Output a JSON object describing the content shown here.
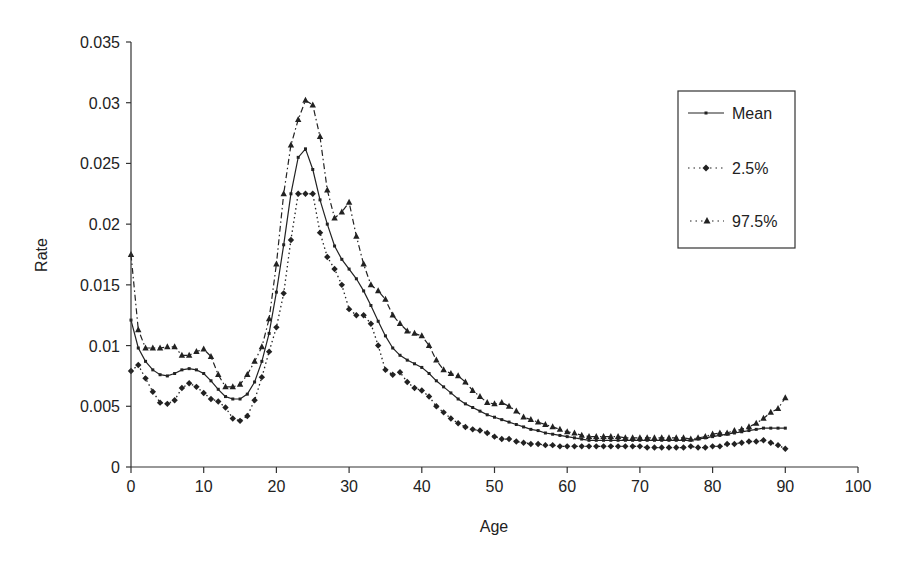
{
  "chart_data": {
    "type": "line",
    "title": "",
    "xlabel": "Age",
    "ylabel": "Rate",
    "xlim": [
      0,
      100
    ],
    "ylim": [
      0,
      0.035
    ],
    "x_ticks": [
      "0",
      "10",
      "20",
      "30",
      "40",
      "50",
      "60",
      "70",
      "80",
      "90",
      "100"
    ],
    "y_ticks": [
      "0",
      "0.005",
      "0.01",
      "0.015",
      "0.02",
      "0.025",
      "0.03",
      "0.035"
    ],
    "grid": false,
    "legend_position": "upper right (boxed)",
    "x": [
      0,
      1,
      2,
      3,
      4,
      5,
      6,
      7,
      8,
      9,
      10,
      11,
      12,
      13,
      14,
      15,
      16,
      17,
      18,
      19,
      20,
      21,
      22,
      23,
      24,
      25,
      26,
      27,
      28,
      29,
      30,
      31,
      32,
      33,
      34,
      35,
      36,
      37,
      38,
      39,
      40,
      41,
      42,
      43,
      44,
      45,
      46,
      47,
      48,
      49,
      50,
      51,
      52,
      53,
      54,
      55,
      56,
      57,
      58,
      59,
      60,
      61,
      62,
      63,
      64,
      65,
      66,
      67,
      68,
      69,
      70,
      71,
      72,
      73,
      74,
      75,
      76,
      77,
      78,
      79,
      80,
      81,
      82,
      83,
      84,
      85,
      86,
      87,
      88,
      89,
      90
    ],
    "series": [
      {
        "name": "Mean",
        "line_style": "solid",
        "marker": "small-square",
        "values": [
          0.0121,
          0.0098,
          0.0087,
          0.008,
          0.0076,
          0.0075,
          0.0077,
          0.008,
          0.0081,
          0.008,
          0.0077,
          0.0071,
          0.0064,
          0.0058,
          0.0056,
          0.0056,
          0.006,
          0.007,
          0.0087,
          0.011,
          0.0144,
          0.0183,
          0.0225,
          0.0255,
          0.0262,
          0.0245,
          0.022,
          0.02,
          0.0182,
          0.0171,
          0.0163,
          0.0155,
          0.0145,
          0.0133,
          0.012,
          0.0108,
          0.0098,
          0.0092,
          0.0088,
          0.0085,
          0.0082,
          0.0077,
          0.0071,
          0.0066,
          0.0061,
          0.0056,
          0.0052,
          0.0049,
          0.0046,
          0.0043,
          0.0041,
          0.0039,
          0.0037,
          0.0035,
          0.0033,
          0.0031,
          0.003,
          0.0028,
          0.0027,
          0.0026,
          0.0025,
          0.0024,
          0.0023,
          0.0022,
          0.0022,
          0.0022,
          0.0022,
          0.0022,
          0.0022,
          0.0022,
          0.0022,
          0.0022,
          0.0022,
          0.0022,
          0.0022,
          0.0022,
          0.0022,
          0.0022,
          0.0023,
          0.0024,
          0.0025,
          0.0026,
          0.0027,
          0.0028,
          0.0029,
          0.003,
          0.0031,
          0.0032,
          0.0032,
          0.0032,
          0.0032
        ]
      },
      {
        "name": "2.5%",
        "line_style": "dotted",
        "marker": "diamond",
        "values": [
          0.0079,
          0.0084,
          0.0073,
          0.0062,
          0.0053,
          0.0052,
          0.0055,
          0.0065,
          0.0069,
          0.0066,
          0.0061,
          0.0056,
          0.0054,
          0.0049,
          0.004,
          0.0038,
          0.0042,
          0.0055,
          0.0074,
          0.0095,
          0.0115,
          0.0143,
          0.0187,
          0.0225,
          0.0225,
          0.0225,
          0.0193,
          0.0173,
          0.0163,
          0.015,
          0.013,
          0.0125,
          0.0125,
          0.0118,
          0.01,
          0.008,
          0.0076,
          0.0078,
          0.007,
          0.0065,
          0.0063,
          0.0058,
          0.005,
          0.0045,
          0.004,
          0.0036,
          0.0033,
          0.0031,
          0.003,
          0.0028,
          0.0025,
          0.0023,
          0.0023,
          0.0021,
          0.002,
          0.0019,
          0.0019,
          0.0018,
          0.0018,
          0.0017,
          0.0017,
          0.0017,
          0.0017,
          0.0017,
          0.0017,
          0.0017,
          0.0017,
          0.0017,
          0.0017,
          0.0017,
          0.0017,
          0.0016,
          0.0016,
          0.0016,
          0.0016,
          0.0016,
          0.0016,
          0.0017,
          0.0016,
          0.0016,
          0.0017,
          0.0017,
          0.0019,
          0.0019,
          0.002,
          0.0021,
          0.0021,
          0.0022,
          0.002,
          0.0018,
          0.0015
        ]
      },
      {
        "name": "97.5%",
        "line_style": "dash-dot",
        "marker": "triangle",
        "values": [
          0.0175,
          0.0113,
          0.0098,
          0.0098,
          0.0098,
          0.0099,
          0.0099,
          0.0092,
          0.0092,
          0.0095,
          0.0097,
          0.0091,
          0.0076,
          0.0066,
          0.0066,
          0.0068,
          0.0076,
          0.0087,
          0.0099,
          0.0122,
          0.0167,
          0.0225,
          0.0265,
          0.0286,
          0.0302,
          0.0298,
          0.0272,
          0.0228,
          0.0205,
          0.021,
          0.0218,
          0.019,
          0.0167,
          0.015,
          0.0145,
          0.0138,
          0.0125,
          0.0118,
          0.0112,
          0.011,
          0.0108,
          0.01,
          0.0088,
          0.008,
          0.0077,
          0.0075,
          0.007,
          0.0063,
          0.0058,
          0.0053,
          0.0052,
          0.0053,
          0.005,
          0.0046,
          0.0041,
          0.0039,
          0.0037,
          0.0035,
          0.0033,
          0.0031,
          0.0029,
          0.0028,
          0.0026,
          0.0025,
          0.0025,
          0.0025,
          0.0025,
          0.0025,
          0.0024,
          0.0024,
          0.0024,
          0.0024,
          0.0024,
          0.0024,
          0.0024,
          0.0024,
          0.0024,
          0.0023,
          0.0024,
          0.0025,
          0.0027,
          0.0028,
          0.0028,
          0.003,
          0.0031,
          0.0033,
          0.0036,
          0.004,
          0.0045,
          0.0048,
          0.0057
        ]
      }
    ]
  },
  "legend": {
    "items": [
      {
        "label": "Mean"
      },
      {
        "label": "2.5%"
      },
      {
        "label": "97.5%"
      }
    ]
  },
  "axes": {
    "x_title": "Age",
    "y_title": "Rate"
  }
}
